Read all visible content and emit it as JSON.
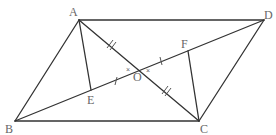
{
  "diagram": {
    "type": "geometry",
    "points": {
      "A": {
        "label": "A",
        "x": 79,
        "y": 20
      },
      "B": {
        "label": "B",
        "x": 15,
        "y": 121
      },
      "C": {
        "label": "C",
        "x": 199,
        "y": 121
      },
      "D": {
        "label": "D",
        "x": 264,
        "y": 20
      },
      "O": {
        "label": "O",
        "x": 139,
        "y": 70
      },
      "E": {
        "label": "E",
        "x": 91,
        "y": 90
      },
      "F": {
        "label": "F",
        "x": 188,
        "y": 51
      }
    },
    "segments": [
      "AB",
      "BC",
      "CD",
      "DA",
      "AC",
      "BD",
      "AE",
      "CF"
    ],
    "equal_marks": {
      "AO_OC": "double tick (//)",
      "EO_OF": "single tick (|)"
    },
    "angle_marks": [
      "x at O (angle AOE side)",
      "x at O (angle COF side)"
    ]
  }
}
